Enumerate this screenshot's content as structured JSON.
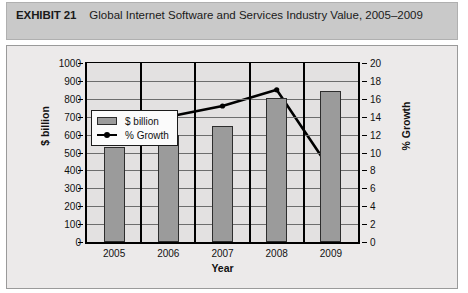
{
  "exhibit": {
    "label": "EXHIBIT 21",
    "title": "Global Internet Software and Services Industry Value, 2005–2009"
  },
  "legend": {
    "items": [
      {
        "label": "$ billion",
        "marker": "bar-swatch"
      },
      {
        "label": "% Growth",
        "marker": "line-marker"
      }
    ]
  },
  "axis_titles": {
    "y_left": "$ billion",
    "y_right": "% Growth",
    "x": "Year"
  },
  "colors": {
    "bar_fill": "#9b9b9b",
    "bar_stroke": "#2d2d2d",
    "line": "#000000",
    "plot_bg": "#e3e1e1",
    "frame_bg": "#eceaea",
    "band_bg": "#c9c9c9",
    "gridline": "#6d6d6d"
  },
  "chart_data": {
    "type": "bar",
    "title": "Global Internet Software and Services Industry Value, 2005–2009",
    "subtitle": "",
    "xlabel": "Year",
    "ylabel": "$ billion",
    "y2label": "% Growth",
    "categories": [
      "2005",
      "2006",
      "2007",
      "2008",
      "2009"
    ],
    "ylim": [
      0,
      1000
    ],
    "yticks": [
      0,
      100,
      200,
      300,
      400,
      500,
      600,
      700,
      800,
      900,
      1000
    ],
    "y2lim": [
      0,
      20
    ],
    "y2ticks": [
      0,
      2,
      4,
      6,
      8,
      10,
      12,
      14,
      16,
      18,
      20
    ],
    "grid": true,
    "legend_position": "upper-left-inside",
    "series": [
      {
        "name": "$ billion",
        "type": "bar",
        "axis": "left",
        "values": [
          530,
          598,
          650,
          805,
          845
        ]
      },
      {
        "name": "% Growth",
        "type": "line",
        "axis": "right",
        "values": [
          null,
          14.0,
          15.2,
          17.0,
          8.0
        ]
      }
    ]
  }
}
